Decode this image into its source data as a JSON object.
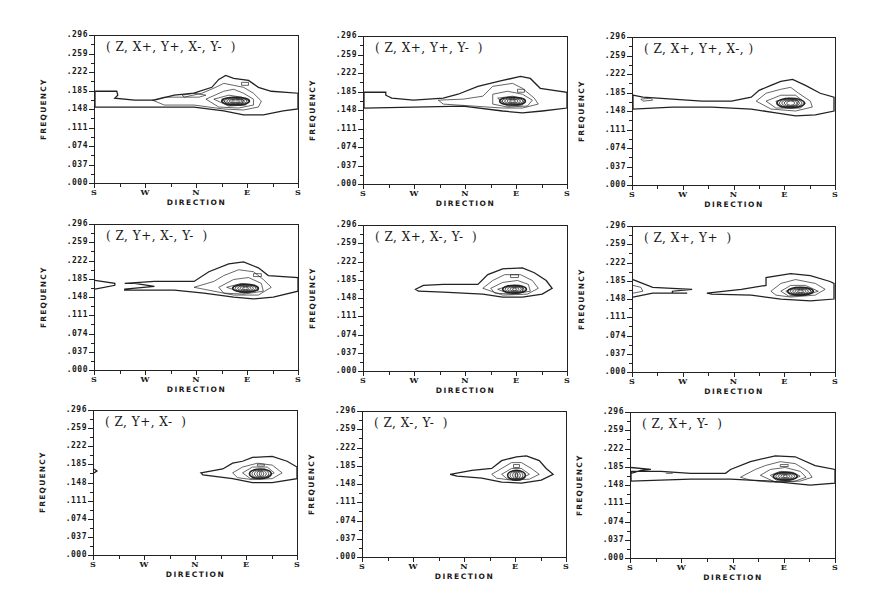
{
  "figure": {
    "colors": {
      "line": "#222222",
      "background": "#ffffff"
    }
  },
  "chart_data": [
    {
      "type": "contour",
      "title": "( Z, X+, Y+, X-, Y-  )",
      "xlabel": "DIRECTION",
      "ylabel": "FREQUENCY",
      "x_ticks": [
        "S",
        "W",
        "N",
        "E",
        "S"
      ],
      "y_ticks": [
        ".296",
        ".259",
        ".222",
        ".185",
        ".148",
        ".111",
        ".074",
        ".037",
        ".000"
      ],
      "ylim": [
        0.0,
        0.296
      ],
      "grid": false,
      "peak": {
        "direction": "E (slightly south of E)",
        "frequency": 0.111
      },
      "notes": "broad band at ~0.10-0.14 across all directions; concentrated peak east-southeast"
    },
    {
      "type": "contour",
      "title": "( Z, X+, Y+, Y-  )",
      "xlabel": "DIRECTION",
      "ylabel": "FREQUENCY",
      "x_ticks": [
        "S",
        "W",
        "N",
        "E",
        "S"
      ],
      "y_ticks": [
        ".296",
        ".259",
        ".222",
        ".185",
        ".148",
        ".111",
        ".074",
        ".037",
        ".000"
      ],
      "ylim": [
        0.0,
        0.296
      ],
      "grid": false,
      "peak": {
        "direction": "E (slightly south of E)",
        "frequency": 0.111
      }
    },
    {
      "type": "contour",
      "title": "( Z, X+, Y+, X-, )",
      "xlabel": "DIRECTION",
      "ylabel": "FREQUENCY",
      "x_ticks": [
        "S",
        "W",
        "N",
        "E",
        "S"
      ],
      "y_ticks": [
        ".296",
        ".259",
        ".222",
        ".185",
        ".148",
        ".111",
        ".074",
        ".037",
        ".000"
      ],
      "ylim": [
        0.0,
        0.296
      ],
      "grid": false,
      "peak": {
        "direction": "E (slightly south of E)",
        "frequency": 0.111
      }
    },
    {
      "type": "contour",
      "title": "( Z, Y+, X-, Y-  )",
      "xlabel": "DIRECTION",
      "ylabel": "FREQUENCY",
      "x_ticks": [
        "S",
        "W",
        "N",
        "E",
        "S"
      ],
      "y_ticks": [
        ".296",
        ".259",
        ".222",
        ".185",
        ".148",
        ".111",
        ".074",
        ".037",
        ".000"
      ],
      "ylim": [
        0.0,
        0.296
      ],
      "grid": false,
      "peak": {
        "direction": "E (slightly south of E)",
        "frequency": 0.111
      }
    },
    {
      "type": "contour",
      "title": "( Z, X+, X-, Y-  )",
      "xlabel": "DIRECTION",
      "ylabel": "FREQUENCY",
      "x_ticks": [
        "S",
        "W",
        "N",
        "E",
        "S"
      ],
      "y_ticks": [
        ".296",
        ".259",
        ".222",
        ".185",
        ".148",
        ".111",
        ".074",
        ".037",
        ".000"
      ],
      "ylim": [
        0.0,
        0.296
      ],
      "grid": false,
      "peak": {
        "direction": "E",
        "frequency": 0.111
      }
    },
    {
      "type": "contour",
      "title": "( Z, X+, Y+  )",
      "xlabel": "DIRECTION",
      "ylabel": "FREQUENCY",
      "x_ticks": [
        "S",
        "W",
        "N",
        "E",
        "S"
      ],
      "y_ticks": [
        ".296",
        ".259",
        ".222",
        ".185",
        ".148",
        ".111",
        ".074",
        ".037",
        ".000"
      ],
      "ylim": [
        0.0,
        0.296
      ],
      "grid": false,
      "peak": {
        "direction": "E (slightly south of E)",
        "frequency": 0.111
      }
    },
    {
      "type": "contour",
      "title": "( Z, Y+, X-  )",
      "xlabel": "DIRECTION",
      "ylabel": "FREQUENCY",
      "x_ticks": [
        "S",
        "W",
        "N",
        "E",
        "S"
      ],
      "y_ticks": [
        ".296",
        ".259",
        ".222",
        ".185",
        ".148",
        ".111",
        ".074",
        ".037",
        ".000"
      ],
      "ylim": [
        0.0,
        0.296
      ],
      "grid": false,
      "peak": {
        "direction": "E (slightly south of E)",
        "frequency": 0.111
      }
    },
    {
      "type": "contour",
      "title": "( Z, X-, Y-  )",
      "xlabel": "DIRECTION",
      "ylabel": "FREQUENCY",
      "x_ticks": [
        "S",
        "W",
        "N",
        "E",
        "S"
      ],
      "y_ticks": [
        ".296",
        ".259",
        ".222",
        ".185",
        ".148",
        ".111",
        ".074",
        ".037",
        ".000"
      ],
      "ylim": [
        0.0,
        0.296
      ],
      "grid": false,
      "peak": {
        "direction": "E",
        "frequency": 0.111
      }
    },
    {
      "type": "contour",
      "title": "( Z, X+, Y-  )",
      "xlabel": "DIRECTION",
      "ylabel": "FREQUENCY",
      "x_ticks": [
        "S",
        "W",
        "N",
        "E",
        "S"
      ],
      "y_ticks": [
        ".296",
        ".259",
        ".222",
        ".185",
        ".148",
        ".111",
        ".074",
        ".037",
        ".000"
      ],
      "ylim": [
        0.0,
        0.296
      ],
      "grid": false,
      "peak": {
        "direction": "E",
        "frequency": 0.111
      }
    }
  ],
  "layout": {
    "panels": [
      {
        "left": 94,
        "top": 35,
        "width": 205,
        "height": 149
      },
      {
        "left": 363,
        "top": 36,
        "width": 205,
        "height": 149
      },
      {
        "left": 632,
        "top": 37,
        "width": 204,
        "height": 149
      },
      {
        "left": 94,
        "top": 224,
        "width": 205,
        "height": 147
      },
      {
        "left": 363,
        "top": 225,
        "width": 205,
        "height": 147
      },
      {
        "left": 632,
        "top": 226,
        "width": 204,
        "height": 147
      },
      {
        "left": 93,
        "top": 410,
        "width": 205,
        "height": 146
      },
      {
        "left": 362,
        "top": 411,
        "width": 205,
        "height": 147
      },
      {
        "left": 630,
        "top": 412,
        "width": 206,
        "height": 147
      }
    ]
  },
  "contours": [
    {
      "outer": "M0,56 L22,56 L23,60 L20,63 L40,65 L60,65 L80,60 L100,58 L118,52 L125,44 L132,40 L140,43 L155,45 L165,52 L178,56 L205,58 L205,74 L190,76 L170,80 L150,80 L130,76 L100,72 L60,72 L0,72 Z",
      "inner": [
        "M58,65 L70,62 L90,62 L108,58 L122,52 L130,48 L140,50 L150,52 L160,58 L168,66 L165,72 L150,75 L130,74 L100,70 L70,70 Z",
        "M112,64 L130,56 L140,54 L150,58 L160,64 L160,70 L145,73 L125,72 Z",
        "M120,64 L135,60 L148,62 L156,66 L152,70 L135,71 Z",
        "M128,64 L140,62 L150,65 L148,69 L135,70 Z",
        "M88,60 L100,58 L112,60 L105,62 L90,62 Z",
        "M148,47 L155,47 L155,50 L148,50 Z"
      ],
      "core": {
        "cx": 142,
        "cy": 66,
        "rx": 14,
        "ry": 4
      }
    },
    {
      "outer": "M0,56 L22,56 L22,59 L28,62 L50,64 L80,62 L95,58 L115,50 L140,44 L158,40 L168,42 L178,52 L205,56 L205,72 L180,75 L160,77 L140,75 L100,70 L50,71 L0,72 Z",
      "inner": [
        "M75,64 L100,63 L120,60 L130,50 L150,47 L160,52 L172,62 L176,68 L160,72 L140,72 L110,70 L80,68 Z",
        "M130,58 L145,55 L160,58 L170,64 L165,70 L145,71 L130,68 Z",
        "M135,62 L150,60 L162,63 L160,69 L145,70 Z",
        "M155,53 L162,53 L162,56 L155,56 Z"
      ],
      "core": {
        "cx": 150,
        "cy": 65,
        "rx": 13,
        "ry": 4
      }
    },
    {
      "outer": "M0,58 L10,60 L40,62 L70,64 L100,64 L120,60 L128,53 L140,48 L150,44 L162,42 L175,48 L190,56 L204,60 L204,74 L185,78 L165,79 L145,76 L120,72 L80,70 L40,70 L0,72 Z",
      "inner": [
        "M125,64 L135,56 L150,52 L160,50 L168,56 L180,64 L182,70 L165,74 L140,72 Z",
        "M135,64 L150,58 L165,58 L175,66 L170,71 L145,71 Z",
        "M145,64 L158,61 L168,64 L166,69 L150,70 Z",
        "M8,62 L18,61 L20,63 L10,64 Z"
      ],
      "core": {
        "cx": 160,
        "cy": 66,
        "rx": 14,
        "ry": 5
      }
    },
    {
      "outer": "M0,57 L20,60 L20,62 L0,66 M30,66 L60,63 L40,60 L30,60 L60,58 L100,58 L115,48 L135,40 L150,38 L165,44 L175,52 L205,54 L205,68 L180,74 L160,76 L140,74 L110,70 L80,67 L30,67 Z",
      "inner": [
        "M100,64 L120,58 L130,52 L145,46 L160,48 L170,56 L178,64 L165,72 L140,72 Z",
        "M125,64 L140,56 L155,54 L168,60 L170,68 L150,71 L130,70 Z",
        "M133,64 L148,60 L162,62 L165,67 L150,70 Z",
        "M160,50 L168,50 L168,53 L160,53 Z"
      ],
      "core": {
        "cx": 152,
        "cy": 65,
        "rx": 13,
        "ry": 4
      }
    },
    {
      "outer": "M52,65 L60,61 L80,60 L115,60 L125,50 L140,44 L160,43 L172,48 L184,56 L190,64 L180,70 L160,73 L140,73 L120,70 L80,68 L55,67 Z",
      "inner": [
        "M120,64 L130,56 L142,50 L158,50 L170,56 L176,64 L165,70 L140,71 Z",
        "M128,64 L140,58 L155,56 L166,60 L168,67 L150,70 L132,69 Z",
        "M135,65 L148,61 L160,63 L160,68 L145,69 Z",
        "M148,50 L156,50 L156,53 L148,53 Z"
      ],
      "core": {
        "cx": 152,
        "cy": 65,
        "rx": 12,
        "ry": 4
      }
    },
    {
      "outer": "M0,54 L20,62 L60,64 L40,66 L40,68 L55,68 L20,68 L0,72 M75,68 L110,64 L135,60 L135,52 L160,48 L180,50 L200,56 L204,58 L204,74 L180,76 L150,74 L120,70 L80,69 Z",
      "inner": [
        "M0,60 L8,62 L10,66 L0,68",
        "M140,66 L150,58 L165,54 L185,58 L195,64 L185,70 L160,72 L145,70 Z",
        "M150,66 L160,60 L175,60 L188,66 L175,70 L158,71 Z",
        "M155,66 L165,62 L178,63 L182,67 L170,70 L160,70 Z"
      ],
      "core": {
        "cx": 170,
        "cy": 66,
        "rx": 13,
        "ry": 4
      }
    },
    {
      "outer": "M0,60 L3,62 L0,64 M108,64 L130,60 L140,54 L150,52 L160,48 L180,47 L195,52 L205,58 L205,70 L180,74 L160,74 L140,70 L110,66 Z",
      "inner": [
        "M140,64 L150,58 L165,54 L180,56 L190,64 L180,70 L160,71 L145,69 Z",
        "M150,64 L160,58 L175,58 L182,64 L172,69 L158,70 Z",
        "M165,55 L172,55 L172,57 L165,57 Z"
      ],
      "core": {
        "cx": 168,
        "cy": 65,
        "rx": 11,
        "ry": 5
      }
    },
    {
      "outer": "M88,64 L110,60 L130,58 L140,50 L155,46 L165,45 L178,50 L185,58 L192,64 L180,70 L160,73 L140,72 L120,68 L95,66 Z",
      "inner": [
        "M130,64 L140,58 L150,52 L160,52 L170,58 L178,64 L168,69 L150,70 L135,68 Z",
        "M140,64 L150,58 L160,58 L168,64 L160,68 L146,69 Z",
        "M152,54 L158,54 L158,57 L152,57 Z"
      ],
      "core": {
        "cx": 155,
        "cy": 65,
        "rx": 9,
        "ry": 5
      }
    },
    {
      "outer": "M0,56 L20,58 L10,59 L0,62 M0,60 L30,60 L60,62 L95,62 L100,58 L120,50 L145,44 L165,45 L185,54 L205,58 L205,72 L180,74 L160,72 L140,70 L100,68 L60,68 L0,70 Z",
      "inner": [
        "M110,66 L125,58 L135,54 L150,50 L165,52 L178,60 L182,66 L170,70 L140,71 L120,69 Z",
        "M130,64 L140,58 L155,56 L170,60 L176,66 L165,70 L145,71 Z",
        "M140,64 L150,60 L163,61 L170,65 L160,69 L146,69 Z",
        "M35,62 L42,62",
        "M150,53 L158,53 L158,55 L150,55 Z"
      ],
      "core": {
        "cx": 155,
        "cy": 65,
        "rx": 12,
        "ry": 4
      }
    }
  ]
}
